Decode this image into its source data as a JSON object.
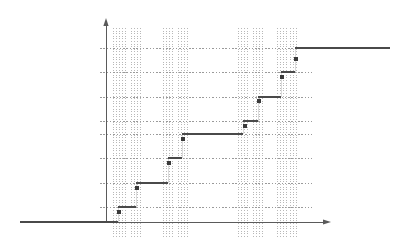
{
  "chart_data": {
    "type": "line",
    "title": "",
    "subtitle": "",
    "xlabel": "",
    "ylabel": "",
    "grid": true,
    "legend": false,
    "legend_position": "none",
    "xlim": [
      0,
      10
    ],
    "ylim": [
      0,
      1
    ],
    "x_axis_arrow": true,
    "y_axis_arrow": true,
    "origin_px": [
      106,
      222
    ],
    "y_gridlines": [
      0.125,
      0.25,
      0.375,
      0.5,
      0.625,
      0.75,
      0.875,
      1.0
    ],
    "y_gridlines_px": [
      207,
      183,
      158,
      134,
      121,
      97,
      72,
      48
    ],
    "series": [
      {
        "name": "ECDF",
        "color": "#4a4a4a",
        "steps": [
          {
            "x": 0.0,
            "y": 0.0,
            "x_px": 20,
            "x2_px": 118,
            "y_px": 222
          },
          {
            "x": 1.0,
            "y": 0.125,
            "x_px": 118,
            "x2_px": 136,
            "y_px": 207
          },
          {
            "x": 1.6,
            "y": 0.25,
            "x_px": 136,
            "x2_px": 168,
            "y_px": 183
          },
          {
            "x": 2.7,
            "y": 0.375,
            "x_px": 168,
            "x2_px": 182,
            "y_px": 158
          },
          {
            "x": 3.2,
            "y": 0.5,
            "x_px": 182,
            "x2_px": 243,
            "y_px": 134
          },
          {
            "x": 5.3,
            "y": 0.625,
            "x_px": 243,
            "x2_px": 258,
            "y_px": 121
          },
          {
            "x": 5.8,
            "y": 0.75,
            "x_px": 258,
            "x2_px": 281,
            "y_px": 97
          },
          {
            "x": 6.6,
            "y": 0.875,
            "x_px": 281,
            "x2_px": 295,
            "y_px": 72
          },
          {
            "x": 7.1,
            "y": 1.0,
            "x_px": 295,
            "x2_px": 390,
            "y_px": 48
          }
        ],
        "markers": [
          {
            "x": 1.0,
            "y": 0.125,
            "x_px": 119,
            "y_px": 212
          },
          {
            "x": 1.6,
            "y": 0.25,
            "x_px": 137,
            "y_px": 188
          },
          {
            "x": 2.7,
            "y": 0.375,
            "x_px": 169,
            "y_px": 163
          },
          {
            "x": 3.2,
            "y": 0.5,
            "x_px": 183,
            "y_px": 139
          },
          {
            "x": 5.3,
            "y": 0.625,
            "x_px": 245,
            "y_px": 126
          },
          {
            "x": 5.8,
            "y": 0.75,
            "x_px": 259,
            "y_px": 101
          },
          {
            "x": 6.6,
            "y": 0.875,
            "x_px": 282,
            "y_px": 77
          },
          {
            "x": 7.1,
            "y": 1.0,
            "x_px": 296,
            "y_px": 59
          }
        ]
      }
    ],
    "rug_clusters": [
      {
        "label": "cluster-1",
        "x_px": [
          113,
          116,
          119,
          122,
          125
        ]
      },
      {
        "label": "cluster-2",
        "x_px": [
          131,
          134,
          137,
          140
        ]
      },
      {
        "label": "cluster-3",
        "x_px": [
          163,
          166,
          169,
          172
        ]
      },
      {
        "label": "cluster-4",
        "x_px": [
          178,
          181,
          184,
          187
        ]
      },
      {
        "label": "cluster-5",
        "x_px": [
          238,
          241,
          244,
          247
        ]
      },
      {
        "label": "cluster-6",
        "x_px": [
          253,
          256,
          259,
          262
        ]
      },
      {
        "label": "cluster-7",
        "x_px": [
          277,
          280,
          283,
          286
        ]
      },
      {
        "label": "cluster-8",
        "x_px": [
          290,
          293,
          296
        ]
      }
    ],
    "colors": {
      "step_line": "#4a4a4a",
      "axis": "#5a5a5a",
      "gridline": "#9a9a9a",
      "rug": "#b8b8b8",
      "marker": "#3a3a3a",
      "background": "#ffffff"
    }
  }
}
